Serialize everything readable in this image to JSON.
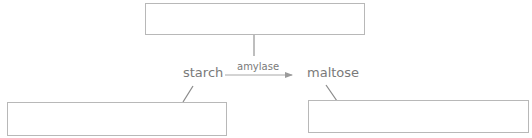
{
  "diagram": {
    "substrate": "starch",
    "enzyme": "amylase",
    "product": "maltose",
    "boxes": {
      "top": "",
      "left": "",
      "right": ""
    },
    "colors": {
      "line": "#a8a8a8",
      "text": "#7a7a7a",
      "box_border": "#b8b8b8"
    }
  }
}
